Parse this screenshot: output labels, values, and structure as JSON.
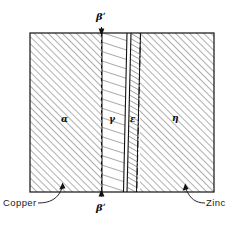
{
  "figure": {
    "background_color": "#ffffff",
    "line_color": "#111111"
  },
  "diagram": {
    "outline": {
      "x": 30,
      "y": 33,
      "width": 184,
      "height": 159
    },
    "regions": [
      {
        "id": "alpha",
        "label": "α",
        "label_x": 63,
        "label_y": 120,
        "x_start": 30,
        "x_end": 102,
        "hatch": "diagonal-up-fine",
        "name": "alpha-phase-region"
      },
      {
        "id": "gamma",
        "label": "γ",
        "label_x": 110,
        "label_y": 120,
        "x_start": 102,
        "x_end": 127,
        "hatch": "horizontal-shallow",
        "name": "gamma-phase-region"
      },
      {
        "id": "epsilon",
        "label": "ε",
        "label_x": 131,
        "label_y": 120,
        "x_start": 127,
        "x_end": 140,
        "hatch": "diagonal-steep",
        "name": "epsilon-phase-region"
      },
      {
        "id": "eta",
        "label": "η",
        "label_x": 174,
        "label_y": 120,
        "x_start": 140,
        "x_end": 214,
        "hatch": "diagonal-up-fine",
        "name": "eta-phase-region"
      }
    ],
    "markers": [
      {
        "id": "beta-prime-top",
        "label": "βʹ",
        "x": 101,
        "y": 18,
        "name": "beta-prime-top-label"
      },
      {
        "id": "beta-prime-bottom",
        "label": "βʹ",
        "x": 101,
        "y": 207,
        "name": "beta-prime-bottom-label"
      }
    ],
    "callouts": [
      {
        "id": "copper",
        "label": "Copper",
        "x": 4,
        "y": 200,
        "name": "copper-callout-label"
      },
      {
        "id": "zinc",
        "label": "Zinc",
        "x": 197,
        "y": 200,
        "name": "zinc-callout-label"
      }
    ]
  }
}
